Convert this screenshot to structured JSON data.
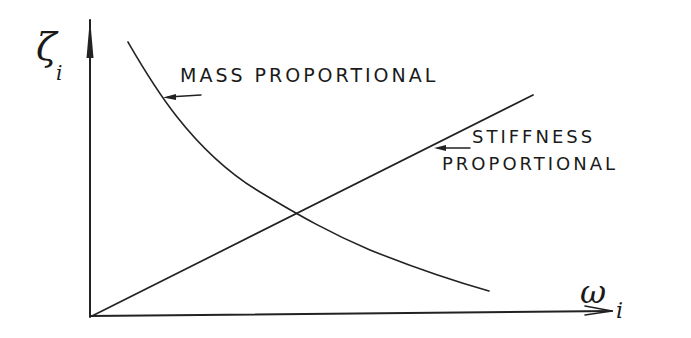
{
  "diagram": {
    "type": "hand-drawn line diagram",
    "y_axis": {
      "symbol": "ζ",
      "subscript": "i"
    },
    "x_axis": {
      "symbol": "ω",
      "subscript": "i"
    },
    "curves": [
      {
        "name": "mass-proportional",
        "shape": "decreasing hyperbola",
        "label": "MASS PROPORTIONAL"
      },
      {
        "name": "stiffness-proportional",
        "shape": "increasing straight line from origin",
        "label_line1": "STIFFNESS",
        "label_line2": "PROPORTIONAL"
      }
    ]
  },
  "labels": {
    "mass": "MASS PROPORTIONAL",
    "stiffness_line1": "STIFFNESS",
    "stiffness_line2": "PROPORTIONAL",
    "y_symbol": "ζ",
    "y_sub": "i",
    "x_symbol": "ω",
    "x_sub": "i"
  },
  "colors": {
    "ink": "#1a1a1a",
    "background": "#ffffff"
  }
}
